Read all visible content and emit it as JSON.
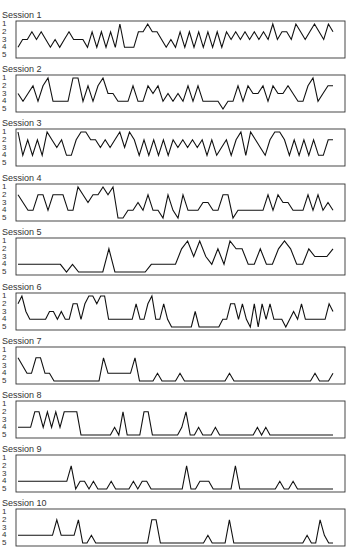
{
  "chart_data": {
    "type": "line",
    "title": "",
    "xlabel": "",
    "ylabel": "",
    "y_ticks": [
      "1",
      "2",
      "3",
      "4",
      "5"
    ],
    "ylim": [
      1,
      5
    ],
    "y_inverted": true,
    "panels": [
      {
        "title": "Session 1",
        "values": [
          4,
          3,
          3,
          2,
          3,
          2,
          3,
          4,
          3,
          4,
          3,
          2,
          3,
          3,
          3,
          4,
          2,
          4,
          2,
          4,
          2,
          4,
          1,
          4,
          4,
          4,
          2,
          2,
          1,
          2,
          2,
          3,
          4,
          3,
          4,
          2,
          4,
          2,
          4,
          2,
          4,
          2,
          4,
          2,
          4,
          2,
          3,
          2,
          3,
          2,
          3,
          2,
          3,
          2,
          3,
          1,
          3,
          2,
          2,
          3,
          1,
          2,
          3,
          2,
          1,
          2,
          3,
          1,
          2
        ]
      },
      {
        "title": "Session 2",
        "values": [
          3,
          4,
          3,
          2,
          4,
          2,
          1,
          4,
          4,
          4,
          4,
          1,
          1,
          4,
          2,
          4,
          2,
          1,
          3,
          3,
          4,
          4,
          4,
          2,
          4,
          4,
          2,
          3,
          2,
          4,
          3,
          4,
          3,
          4,
          2,
          4,
          2,
          4,
          4,
          4,
          4,
          5,
          4,
          4,
          2,
          4,
          2,
          3,
          3,
          2,
          4,
          2,
          3,
          3,
          2,
          3,
          4,
          4,
          2,
          1,
          4,
          3,
          2,
          2
        ]
      },
      {
        "title": "Session 3",
        "values": [
          1,
          4,
          2,
          4,
          2,
          4,
          1,
          2,
          3,
          2,
          4,
          4,
          2,
          1,
          1,
          2,
          2,
          3,
          2,
          3,
          2,
          1,
          3,
          1,
          2,
          4,
          2,
          4,
          2,
          4,
          2,
          4,
          2,
          3,
          2,
          3,
          2,
          3,
          2,
          4,
          2,
          4,
          3,
          2,
          4,
          2,
          1,
          4,
          1,
          2,
          3,
          4,
          2,
          1,
          1,
          2,
          4,
          2,
          4,
          2,
          4,
          2,
          4,
          4,
          2,
          2
        ]
      },
      {
        "title": "Session 4",
        "values": [
          2,
          3,
          4,
          4,
          2,
          2,
          4,
          2,
          2,
          2,
          4,
          4,
          1,
          2,
          3,
          2,
          2,
          1,
          2,
          1,
          5,
          5,
          4,
          4,
          3,
          4,
          2,
          4,
          4,
          5,
          2,
          4,
          5,
          2,
          4,
          4,
          4,
          3,
          3,
          4,
          4,
          2,
          2,
          5,
          4,
          4,
          4,
          4,
          4,
          4,
          2,
          4,
          2,
          3,
          3,
          4,
          4,
          4,
          2,
          4,
          2,
          4,
          3,
          4
        ]
      },
      {
        "title": "Session 5",
        "values": [
          4,
          4,
          4,
          4,
          4,
          4,
          4,
          4,
          5,
          4,
          5,
          5,
          5,
          5,
          5,
          2,
          5,
          5,
          5,
          5,
          5,
          5,
          4,
          4,
          4,
          4,
          4,
          2,
          1,
          3,
          1,
          3,
          4,
          2,
          4,
          1,
          2,
          2,
          4,
          4,
          2,
          4,
          4,
          2,
          1,
          2,
          4,
          4,
          2,
          3,
          3,
          3,
          2
        ]
      },
      {
        "title": "Session 6",
        "values": [
          2,
          1,
          3,
          4,
          4,
          4,
          4,
          4,
          3,
          3,
          4,
          3,
          4,
          4,
          2,
          2,
          4,
          2,
          1,
          1,
          2,
          1,
          1,
          4,
          4,
          4,
          4,
          4,
          4,
          4,
          2,
          4,
          4,
          2,
          1,
          4,
          4,
          2,
          4,
          5,
          5,
          5,
          5,
          5,
          5,
          3,
          5,
          5,
          5,
          5,
          5,
          5,
          4,
          4,
          2,
          2,
          4,
          2,
          4,
          5,
          2,
          5,
          2,
          4,
          2,
          4,
          4,
          4,
          5,
          4,
          3,
          4,
          2,
          4,
          4,
          4,
          4,
          4,
          4,
          2,
          3
        ]
      },
      {
        "title": "Session 7",
        "values": [
          2,
          3,
          4,
          4,
          2,
          2,
          4,
          4,
          5,
          5,
          5,
          5,
          5,
          5,
          5,
          5,
          5,
          5,
          5,
          2,
          4,
          4,
          4,
          4,
          4,
          4,
          2,
          5,
          5,
          5,
          5,
          4,
          5,
          5,
          5,
          5,
          4,
          5,
          5,
          5,
          5,
          5,
          5,
          5,
          5,
          5,
          5,
          4,
          5,
          5,
          5,
          5,
          5,
          5,
          5,
          5,
          5,
          5,
          5,
          5,
          5,
          5,
          5,
          5,
          5,
          5,
          4,
          5,
          5,
          5,
          4
        ]
      },
      {
        "title": "Session 8",
        "values": [
          4,
          4,
          4,
          4,
          2,
          2,
          4,
          2,
          4,
          2,
          4,
          2,
          2,
          2,
          2,
          5,
          5,
          5,
          5,
          5,
          5,
          5,
          5,
          4,
          5,
          2,
          5,
          5,
          5,
          5,
          2,
          2,
          5,
          5,
          5,
          5,
          5,
          5,
          5,
          4,
          2,
          5,
          5,
          4,
          5,
          5,
          5,
          4,
          5,
          5,
          5,
          5,
          5,
          5,
          5,
          5,
          5,
          4,
          5,
          4,
          5,
          5,
          5,
          5,
          5,
          5,
          5,
          5,
          5,
          5,
          5,
          5,
          5,
          5,
          5,
          5
        ]
      },
      {
        "title": "Session 9",
        "values": [
          4,
          4,
          4,
          4,
          4,
          4,
          4,
          4,
          4,
          4,
          4,
          4,
          2,
          5,
          4,
          4,
          5,
          4,
          5,
          5,
          5,
          4,
          5,
          5,
          5,
          5,
          4,
          5,
          4,
          4,
          5,
          5,
          5,
          5,
          5,
          5,
          5,
          5,
          2,
          5,
          5,
          4,
          4,
          4,
          5,
          5,
          5,
          5,
          5,
          2,
          5,
          5,
          5,
          5,
          5,
          5,
          5,
          5,
          5,
          4,
          5,
          5,
          4,
          5,
          5,
          5,
          5,
          5,
          5,
          5,
          5,
          5
        ]
      },
      {
        "title": "Session 10",
        "values": [
          4,
          4,
          4,
          4,
          4,
          4,
          4,
          4,
          4,
          2,
          4,
          4,
          4,
          4,
          2,
          5,
          5,
          4,
          5,
          5,
          5,
          5,
          5,
          5,
          5,
          5,
          5,
          5,
          5,
          5,
          5,
          2,
          2,
          5,
          5,
          5,
          5,
          5,
          5,
          5,
          5,
          5,
          5,
          5,
          4,
          5,
          5,
          5,
          5,
          2,
          5,
          5,
          5,
          5,
          5,
          5,
          5,
          5,
          5,
          5,
          5,
          5,
          5,
          5,
          5,
          5,
          5,
          4,
          5,
          5,
          2,
          4,
          5,
          5
        ]
      }
    ]
  }
}
